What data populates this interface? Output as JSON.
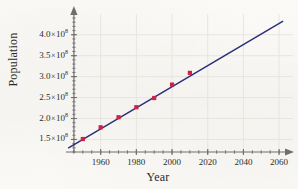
{
  "chart_data": {
    "type": "scatter",
    "title": "",
    "xlabel": "Year",
    "ylabel": "Population",
    "xlim": [
      1940,
      2065
    ],
    "ylim": [
      120000000,
      440000000
    ],
    "grid": true,
    "legend": "none",
    "x_ticks": [
      1960,
      1980,
      2000,
      2020,
      2040,
      2060
    ],
    "x_tick_labels": [
      "1960",
      "1980",
      "2000",
      "2020",
      "2040",
      "2060"
    ],
    "x_minor_tick_step": 5,
    "y_ticks": [
      150000000,
      200000000,
      250000000,
      300000000,
      350000000,
      400000000
    ],
    "y_tick_labels": [
      {
        "mantissa": "1.5",
        "times": "×",
        "base": "10",
        "exponent": "8"
      },
      {
        "mantissa": "2.0",
        "times": "×",
        "base": "10",
        "exponent": "8"
      },
      {
        "mantissa": "2.5",
        "times": "×",
        "base": "10",
        "exponent": "8"
      },
      {
        "mantissa": "3.0",
        "times": "×",
        "base": "10",
        "exponent": "8"
      },
      {
        "mantissa": "3.5",
        "times": "×",
        "base": "10",
        "exponent": "8"
      },
      {
        "mantissa": "4.0",
        "times": "×",
        "base": "10",
        "exponent": "8"
      }
    ],
    "y_minor_tick_step": 10000000,
    "series": [
      {
        "name": "Population data",
        "type": "scatter",
        "marker": "square",
        "color": "#cf2144",
        "x": [
          1950,
          1960,
          1970,
          1980,
          1990,
          2000,
          2010
        ],
        "y": [
          151000000,
          179000000,
          203000000,
          227000000,
          249000000,
          281000000,
          309000000
        ]
      },
      {
        "name": "Linear regression line",
        "type": "line",
        "color": "#2b2f7a",
        "x": [
          1942,
          2062
        ],
        "y": [
          130000000,
          432000000
        ]
      }
    ],
    "colors": {
      "point": "#cf2144",
      "line": "#2b2f7a",
      "axis": "#6e6e6e",
      "grid": "#e7e5e0",
      "text": "#2a2a2a",
      "background": "#fbfaf7"
    }
  },
  "axes": {
    "y_title": "Population",
    "x_title": "Year"
  }
}
